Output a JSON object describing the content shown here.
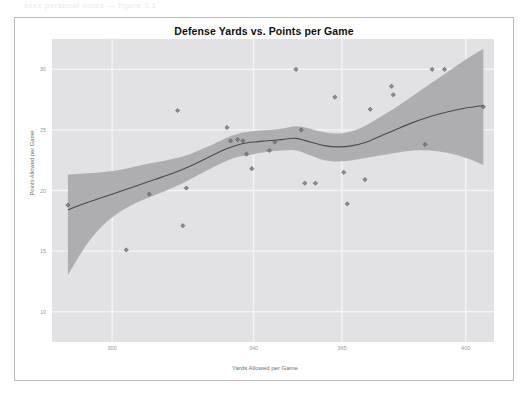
{
  "top_fragment": "xxxx personal notes — figure 3.1",
  "figure": {
    "title": "Defense Yards vs. Points per Game",
    "x_axis_title": "Yards Allowed per Game",
    "y_axis_title": "Points Allowed per Game"
  },
  "colors": {
    "panel_background": "#e2e2e4",
    "gridline": "#f4f4f6",
    "confidence_band": "#a9a9ad",
    "trend_line": "#4a4a50",
    "point": "#6e6e74",
    "card_border": "#bcbcbc",
    "tick_label": "#9a9a9f",
    "axis_title": "#6d6d72",
    "title": "#101010"
  },
  "chart_data": {
    "type": "scatter",
    "title": "Defense Yards vs. Points per Game",
    "xlabel": "Yards Allowed per Game",
    "ylabel": "Points Allowed per Game",
    "xlim": [
      283,
      408
    ],
    "ylim": [
      7.5,
      32.5
    ],
    "grid": true,
    "legend": null,
    "xticks": [
      300,
      340,
      365,
      400
    ],
    "xtick_labels": [
      "300",
      "340",
      "365",
      "400"
    ],
    "yticks": [
      10,
      15,
      20,
      25,
      30
    ],
    "ytick_labels": [
      "10",
      "15",
      "20",
      "25",
      "30"
    ],
    "series": [
      {
        "name": "Teams",
        "type": "scatter",
        "marker": "diamond",
        "points": [
          {
            "x": 287.5,
            "y": 18.8
          },
          {
            "x": 304.0,
            "y": 15.1
          },
          {
            "x": 310.5,
            "y": 19.7
          },
          {
            "x": 318.5,
            "y": 26.6
          },
          {
            "x": 320.0,
            "y": 17.1
          },
          {
            "x": 321.0,
            "y": 20.2
          },
          {
            "x": 332.5,
            "y": 25.2
          },
          {
            "x": 333.5,
            "y": 24.1
          },
          {
            "x": 335.5,
            "y": 24.2
          },
          {
            "x": 337.0,
            "y": 24.1
          },
          {
            "x": 338.0,
            "y": 23.0
          },
          {
            "x": 339.5,
            "y": 21.8
          },
          {
            "x": 344.5,
            "y": 23.3
          },
          {
            "x": 346.0,
            "y": 24.0
          },
          {
            "x": 352.0,
            "y": 30.0
          },
          {
            "x": 353.5,
            "y": 25.0
          },
          {
            "x": 354.5,
            "y": 20.6
          },
          {
            "x": 357.5,
            "y": 20.6
          },
          {
            "x": 363.0,
            "y": 27.7
          },
          {
            "x": 365.5,
            "y": 21.5
          },
          {
            "x": 366.5,
            "y": 18.9
          },
          {
            "x": 371.5,
            "y": 20.9
          },
          {
            "x": 373.0,
            "y": 26.7
          },
          {
            "x": 379.0,
            "y": 28.6
          },
          {
            "x": 379.5,
            "y": 27.9
          },
          {
            "x": 388.5,
            "y": 23.8
          },
          {
            "x": 390.5,
            "y": 30.0
          },
          {
            "x": 394.0,
            "y": 30.0
          },
          {
            "x": 405.0,
            "y": 26.9
          }
        ]
      },
      {
        "name": "LOESS smooth",
        "type": "line",
        "points": [
          {
            "x": 287.5,
            "y": 18.4
          },
          {
            "x": 292.0,
            "y": 18.9
          },
          {
            "x": 297.0,
            "y": 19.4
          },
          {
            "x": 302.0,
            "y": 19.9
          },
          {
            "x": 307.0,
            "y": 20.4
          },
          {
            "x": 312.0,
            "y": 20.9
          },
          {
            "x": 317.0,
            "y": 21.4
          },
          {
            "x": 322.0,
            "y": 22.0
          },
          {
            "x": 327.0,
            "y": 22.7
          },
          {
            "x": 332.0,
            "y": 23.4
          },
          {
            "x": 336.0,
            "y": 23.8
          },
          {
            "x": 340.0,
            "y": 24.0
          },
          {
            "x": 344.0,
            "y": 24.1
          },
          {
            "x": 348.0,
            "y": 24.2
          },
          {
            "x": 352.0,
            "y": 24.3
          },
          {
            "x": 356.0,
            "y": 24.0
          },
          {
            "x": 360.0,
            "y": 23.7
          },
          {
            "x": 364.0,
            "y": 23.6
          },
          {
            "x": 368.0,
            "y": 23.7
          },
          {
            "x": 372.0,
            "y": 24.0
          },
          {
            "x": 376.0,
            "y": 24.5
          },
          {
            "x": 380.0,
            "y": 25.0
          },
          {
            "x": 385.0,
            "y": 25.6
          },
          {
            "x": 390.0,
            "y": 26.1
          },
          {
            "x": 395.0,
            "y": 26.5
          },
          {
            "x": 400.0,
            "y": 26.8
          },
          {
            "x": 405.0,
            "y": 27.0
          }
        ]
      },
      {
        "name": "95% confidence band",
        "type": "band",
        "upper": [
          {
            "x": 287.5,
            "y": 21.3
          },
          {
            "x": 292.0,
            "y": 21.4
          },
          {
            "x": 297.0,
            "y": 21.5
          },
          {
            "x": 302.0,
            "y": 21.7
          },
          {
            "x": 307.0,
            "y": 22.0
          },
          {
            "x": 312.0,
            "y": 22.3
          },
          {
            "x": 317.0,
            "y": 22.6
          },
          {
            "x": 322.0,
            "y": 23.0
          },
          {
            "x": 327.0,
            "y": 23.6
          },
          {
            "x": 332.0,
            "y": 24.3
          },
          {
            "x": 336.0,
            "y": 24.7
          },
          {
            "x": 340.0,
            "y": 24.9
          },
          {
            "x": 344.0,
            "y": 25.0
          },
          {
            "x": 348.0,
            "y": 25.1
          },
          {
            "x": 352.0,
            "y": 25.3
          },
          {
            "x": 356.0,
            "y": 25.1
          },
          {
            "x": 360.0,
            "y": 24.8
          },
          {
            "x": 364.0,
            "y": 24.7
          },
          {
            "x": 368.0,
            "y": 24.9
          },
          {
            "x": 372.0,
            "y": 25.4
          },
          {
            "x": 376.0,
            "y": 26.1
          },
          {
            "x": 380.0,
            "y": 26.8
          },
          {
            "x": 385.0,
            "y": 27.8
          },
          {
            "x": 390.0,
            "y": 28.8
          },
          {
            "x": 395.0,
            "y": 29.8
          },
          {
            "x": 400.0,
            "y": 30.8
          },
          {
            "x": 405.0,
            "y": 31.7
          }
        ],
        "lower": [
          {
            "x": 287.5,
            "y": 13.0
          },
          {
            "x": 292.0,
            "y": 15.2
          },
          {
            "x": 297.0,
            "y": 17.0
          },
          {
            "x": 302.0,
            "y": 18.2
          },
          {
            "x": 307.0,
            "y": 19.0
          },
          {
            "x": 312.0,
            "y": 19.6
          },
          {
            "x": 317.0,
            "y": 20.2
          },
          {
            "x": 322.0,
            "y": 20.9
          },
          {
            "x": 327.0,
            "y": 21.7
          },
          {
            "x": 332.0,
            "y": 22.4
          },
          {
            "x": 336.0,
            "y": 22.8
          },
          {
            "x": 340.0,
            "y": 23.0
          },
          {
            "x": 344.0,
            "y": 23.2
          },
          {
            "x": 348.0,
            "y": 23.3
          },
          {
            "x": 352.0,
            "y": 23.3
          },
          {
            "x": 356.0,
            "y": 22.9
          },
          {
            "x": 360.0,
            "y": 22.5
          },
          {
            "x": 364.0,
            "y": 22.4
          },
          {
            "x": 368.0,
            "y": 22.5
          },
          {
            "x": 372.0,
            "y": 22.7
          },
          {
            "x": 376.0,
            "y": 22.9
          },
          {
            "x": 380.0,
            "y": 23.1
          },
          {
            "x": 385.0,
            "y": 23.3
          },
          {
            "x": 390.0,
            "y": 23.3
          },
          {
            "x": 395.0,
            "y": 23.1
          },
          {
            "x": 400.0,
            "y": 22.7
          },
          {
            "x": 405.0,
            "y": 22.1
          }
        ]
      }
    ]
  }
}
